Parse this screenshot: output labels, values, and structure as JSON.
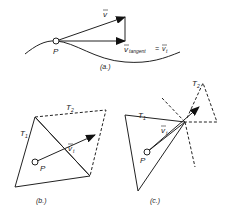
{
  "panel_a": {
    "caption": "(a.)",
    "point_label": "P",
    "v_label": "v",
    "v_tangent_label": "v",
    "v_tangent_sub": "tangent",
    "equals": "=",
    "vt_label": "v",
    "vt_sub": "t"
  },
  "panel_b": {
    "caption": "(b.)",
    "t1_label": "T",
    "t1_sub": "1",
    "t2_label": "T",
    "t2_sub": "2",
    "vt_label": "v",
    "vt_sub": "t",
    "point_label": "P"
  },
  "panel_c": {
    "caption": "(c.)",
    "t1_label": "T",
    "t1_sub": "1",
    "t2_label": "T",
    "t2_sub": "2",
    "vt_label": "v",
    "vt_sub": "t",
    "point_label": "P"
  },
  "colors": {
    "stroke": "#222222",
    "background": "#ffffff"
  }
}
